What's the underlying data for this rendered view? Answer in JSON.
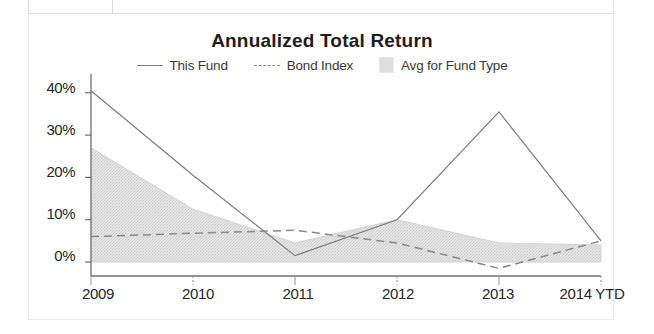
{
  "chart_data": {
    "type": "area",
    "title": "Annualized Total Return",
    "xlabel": "",
    "ylabel": "",
    "categories": [
      "2009",
      "2010",
      "2011",
      "2012",
      "2013",
      "2014 YTD"
    ],
    "ylim": [
      -3,
      42
    ],
    "yticks": [
      0,
      10,
      20,
      30,
      40
    ],
    "ytick_labels": [
      "0%",
      "10%",
      "20%",
      "30%",
      "40%"
    ],
    "grid": false,
    "legend_position": "top",
    "series": [
      {
        "name": "This Fund",
        "style": "solid-line",
        "color": "#7d7d7d",
        "values": [
          40.5,
          20.5,
          1.5,
          10.0,
          35.5,
          5.0
        ]
      },
      {
        "name": "Bond Index",
        "style": "dashed-line",
        "color": "#8a8a8a",
        "values": [
          6.0,
          6.8,
          7.5,
          4.5,
          -1.5,
          5.0
        ]
      },
      {
        "name": "Avg for Fund Type",
        "style": "filled-area",
        "color": "#dcdcdc",
        "values": [
          27.0,
          12.5,
          4.5,
          10.0,
          4.5,
          4.0
        ]
      }
    ]
  },
  "chart": {
    "title": "Annualized Total Return",
    "legend": [
      {
        "label": "This Fund",
        "swatch": "solid-line-swatch"
      },
      {
        "label": "Bond Index",
        "swatch": "dashed-line-swatch"
      },
      {
        "label": "Avg for Fund Type",
        "swatch": "area-fill-swatch"
      }
    ],
    "y_axis": {
      "labels": [
        "40%",
        "30%",
        "20%",
        "10%",
        "0%"
      ]
    },
    "x_axis": {
      "labels": [
        "2009",
        "2010",
        "2011",
        "2012",
        "2013",
        "2014 YTD"
      ]
    }
  }
}
